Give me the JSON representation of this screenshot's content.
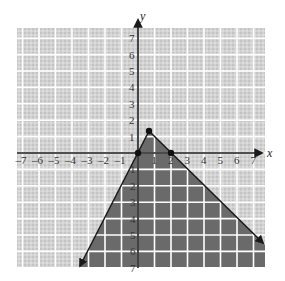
{
  "chart_data": {
    "type": "line",
    "title": "",
    "xlabel": "x",
    "ylabel": "y",
    "xlim": [
      -7.5,
      7.5
    ],
    "ylim": [
      -7.2,
      7.7
    ],
    "grid": true,
    "x_ticks": [
      "-7",
      "-6",
      "-5",
      "-4",
      "-3",
      "-2",
      "-1",
      "1",
      "2",
      "3",
      "4",
      "5",
      "6",
      "7"
    ],
    "y_ticks": [
      "7",
      "6",
      "5",
      "4",
      "3",
      "2",
      "1",
      "-1",
      "-2",
      "-3",
      "-4",
      "-5",
      "-6",
      "-7"
    ],
    "series": [
      {
        "name": "y = 2x",
        "points": [
          [
            -3.5,
            -7
          ],
          [
            0.6667,
            1.3333
          ]
        ],
        "style": "solid-with-arrow"
      },
      {
        "name": "y = -x + 2",
        "points": [
          [
            0.6667,
            1.3333
          ],
          [
            7.6,
            -5.6
          ]
        ],
        "style": "solid-with-arrow"
      }
    ],
    "marked_points": [
      [
        0,
        0
      ],
      [
        2,
        0
      ],
      [
        0.6667,
        1.3333
      ]
    ],
    "shaded_region": {
      "description": "Region below both lines: y <= 2x and y <= -x + 2",
      "vertices": [
        [
          0.6667,
          1.3333
        ],
        [
          7.6,
          -5.6
        ],
        [
          7.6,
          -7.2
        ],
        [
          -3.6,
          -7.2
        ]
      ]
    },
    "colors": {
      "background_grid": "#cfcfcf",
      "grid_lines": "#ffffff",
      "shaded": "#6a6a6a",
      "axes": "#1a1a1a",
      "lines": "#1a1a1a"
    }
  }
}
